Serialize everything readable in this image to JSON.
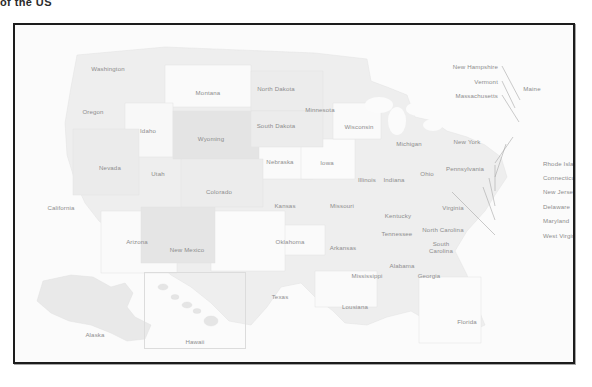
{
  "page": {
    "cut_off_title": "of the US",
    "background": "#ffffff"
  },
  "frame": {
    "border_color": "#1c1c1c",
    "fill_color": "#fbfbfb"
  },
  "map": {
    "title": "United States map with state labels",
    "label_color": "#8d8d8d",
    "state_fill_light": "#f7f7f7",
    "state_fill_mid": "#efefef",
    "state_fill_dark": "#e6e6e6",
    "state_border": "#e2e2e2",
    "leader_line_color": "#a8a8a8",
    "inset_border": "#dcdcdc",
    "states": [
      {
        "name": "Washington",
        "x": 93,
        "y": 43,
        "shade": "mid"
      },
      {
        "name": "Oregon",
        "x": 78,
        "y": 86,
        "shade": "mid"
      },
      {
        "name": "Idaho",
        "x": 133,
        "y": 105,
        "shade": "light"
      },
      {
        "name": "Montana",
        "x": 193,
        "y": 67,
        "shade": "light"
      },
      {
        "name": "Wyoming",
        "x": 196,
        "y": 113,
        "shade": "dark"
      },
      {
        "name": "Nevada",
        "x": 95,
        "y": 142,
        "shade": "mid"
      },
      {
        "name": "Utah",
        "x": 143,
        "y": 148,
        "shade": "mid"
      },
      {
        "name": "California",
        "x": 46,
        "y": 182,
        "shade": "light"
      },
      {
        "name": "Arizona",
        "x": 122,
        "y": 216,
        "shade": "light"
      },
      {
        "name": "Colorado",
        "x": 204,
        "y": 166,
        "shade": "mid"
      },
      {
        "name": "New Mexico",
        "x": 172,
        "y": 224,
        "shade": "dark"
      },
      {
        "name": "North Dakota",
        "x": 261,
        "y": 63,
        "shade": "mid"
      },
      {
        "name": "South Dakota",
        "x": 261,
        "y": 100,
        "shade": "mid"
      },
      {
        "name": "Nebraska",
        "x": 265,
        "y": 136,
        "shade": "light"
      },
      {
        "name": "Kansas",
        "x": 270,
        "y": 180,
        "shade": "mid"
      },
      {
        "name": "Oklahoma",
        "x": 275,
        "y": 216,
        "shade": "light"
      },
      {
        "name": "Texas",
        "x": 265,
        "y": 271,
        "shade": "light"
      },
      {
        "name": "Minnesota",
        "x": 305,
        "y": 84,
        "shade": "mid"
      },
      {
        "name": "Iowa",
        "x": 312,
        "y": 137,
        "shade": "light"
      },
      {
        "name": "Missouri",
        "x": 327,
        "y": 180,
        "shade": "mid"
      },
      {
        "name": "Arkansas",
        "x": 328,
        "y": 222,
        "shade": "mid"
      },
      {
        "name": "Lousiana",
        "x": 340,
        "y": 281,
        "shade": "light"
      },
      {
        "name": "Wisconsin",
        "x": 344,
        "y": 101,
        "shade": "light"
      },
      {
        "name": "Illinois",
        "x": 352,
        "y": 154,
        "shade": "mid"
      },
      {
        "name": "Indiana",
        "x": 379,
        "y": 154,
        "shade": "mid"
      },
      {
        "name": "Michigan",
        "x": 394,
        "y": 118,
        "shade": "mid"
      },
      {
        "name": "Ohio",
        "x": 412,
        "y": 148,
        "shade": "mid"
      },
      {
        "name": "Kentucky",
        "x": 383,
        "y": 190,
        "shade": "mid"
      },
      {
        "name": "Tennessee",
        "x": 382,
        "y": 208,
        "shade": "mid"
      },
      {
        "name": "Mississippi",
        "x": 352,
        "y": 250,
        "shade": "mid"
      },
      {
        "name": "Alabama",
        "x": 387,
        "y": 240,
        "shade": "mid"
      },
      {
        "name": "Georgia",
        "x": 414,
        "y": 250,
        "shade": "mid"
      },
      {
        "name": "Florida",
        "x": 452,
        "y": 296,
        "shade": "light"
      },
      {
        "name": "South Carolina",
        "x": 426,
        "y": 222,
        "shade": "mid",
        "two_line": true
      },
      {
        "name": "North Carolina",
        "x": 428,
        "y": 204,
        "shade": "mid"
      },
      {
        "name": "Virginia",
        "x": 438,
        "y": 182,
        "shade": "mid"
      },
      {
        "name": "Pennsylvania",
        "x": 450,
        "y": 143,
        "shade": "mid"
      },
      {
        "name": "New York",
        "x": 452,
        "y": 116,
        "shade": "mid"
      },
      {
        "name": "Maine",
        "x": 517,
        "y": 63,
        "shade": "mid"
      },
      {
        "name": "Alaska",
        "x": 80,
        "y": 309,
        "shade": "mid"
      },
      {
        "name": "Hawaii",
        "x": 180,
        "y": 316,
        "shade": "mid"
      }
    ],
    "callouts": [
      {
        "name": "New Hampshire",
        "lx": 483,
        "ly": 41,
        "side": "right",
        "tx": 505,
        "ty": 75
      },
      {
        "name": "Vermont",
        "lx": 483,
        "ly": 56,
        "side": "right",
        "tx": 500,
        "ty": 83
      },
      {
        "name": "Massachusetts",
        "lx": 483,
        "ly": 70,
        "side": "right",
        "tx": 504,
        "ty": 97
      },
      {
        "name": "Rhode Island",
        "lx": 528,
        "ly": 138,
        "side": "left",
        "tx": 498,
        "ty": 112
      },
      {
        "name": "Connecticut",
        "lx": 528,
        "ly": 152,
        "side": "left",
        "tx": 491,
        "ty": 119
      },
      {
        "name": "New Jersey",
        "lx": 528,
        "ly": 166,
        "side": "left",
        "tx": 480,
        "ty": 140
      },
      {
        "name": "Delaware",
        "lx": 528,
        "ly": 181,
        "side": "left",
        "tx": 474,
        "ty": 153
      },
      {
        "name": "Maryland",
        "lx": 528,
        "ly": 195,
        "side": "left",
        "tx": 468,
        "ty": 162
      },
      {
        "name": "West Virginia",
        "lx": 528,
        "ly": 210,
        "side": "left",
        "tx": 437,
        "ty": 167
      }
    ]
  }
}
